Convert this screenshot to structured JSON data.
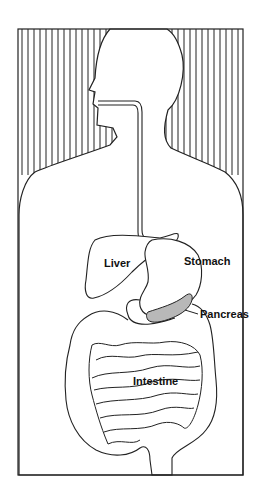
{
  "diagram": {
    "labels": {
      "liver": "Liver",
      "stomach": "Stomach",
      "pancreas": "Pancreas",
      "intestine": "Intestine"
    },
    "colors": {
      "line": "#222222",
      "pancreas_fill": "#b8b8b8",
      "background": "#ffffff"
    }
  }
}
